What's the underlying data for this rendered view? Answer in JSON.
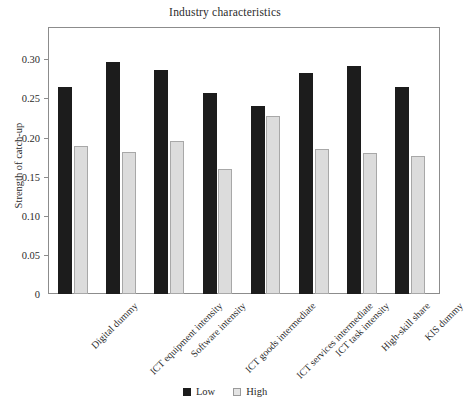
{
  "chart_data": {
    "type": "bar",
    "title": "Industry characteristics",
    "xlabel": "",
    "ylabel": "Strength of catch-up",
    "ylim": [
      0,
      0.32
    ],
    "yticks": [
      0,
      0.05,
      0.1,
      0.15,
      0.2,
      0.25,
      0.3
    ],
    "ytick_labels": [
      "0",
      "0.05",
      "0.10",
      "0.15",
      "0.20",
      "0.25",
      "0.30"
    ],
    "grid": false,
    "legend_position": "bottom",
    "categories": [
      "Digital dummy",
      "ICT equipment intensity",
      "Software intensity",
      "ICT goods intermediate",
      "ICT services intermediate",
      "ICT task intensity",
      "High-skill share",
      "KIS dummy"
    ],
    "series": [
      {
        "name": "Low",
        "color": "#1c1c1c",
        "values": [
          0.265,
          0.297,
          0.286,
          0.257,
          0.24,
          0.283,
          0.292,
          0.264
        ]
      },
      {
        "name": "High",
        "color": "#dcdcdc",
        "values": [
          0.189,
          0.181,
          0.196,
          0.16,
          0.228,
          0.185,
          0.18,
          0.177
        ]
      }
    ]
  },
  "legend": {
    "items": [
      {
        "label": "Low"
      },
      {
        "label": "High"
      }
    ]
  }
}
